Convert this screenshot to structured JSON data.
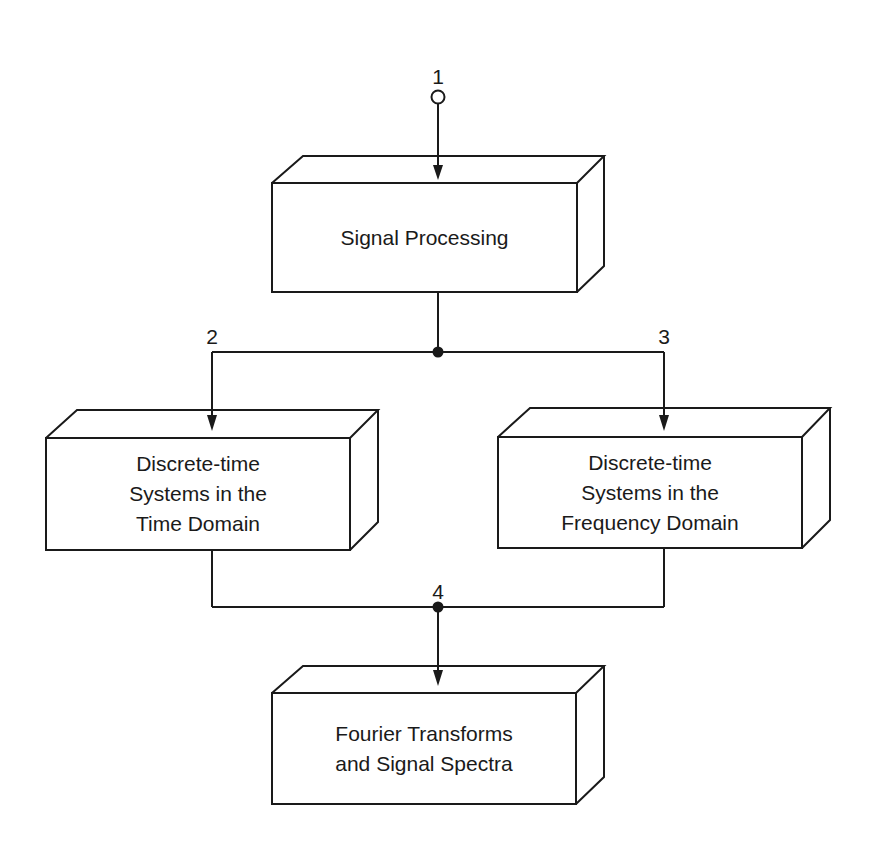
{
  "diagram": {
    "line_color": "#1a1a1a",
    "background": "#ffffff",
    "nodes": {
      "n1": "1",
      "n2": "2",
      "n3": "3",
      "n4": "4"
    },
    "boxes": {
      "signal_processing": {
        "lines": [
          "Signal Processing"
        ]
      },
      "time_domain": {
        "lines": [
          "Discrete-time",
          "Systems in the",
          "Time Domain"
        ]
      },
      "frequency_domain": {
        "lines": [
          "Discrete-time",
          "Systems in the",
          "Frequency Domain"
        ]
      },
      "fourier": {
        "lines": [
          "Fourier Transforms",
          "and Signal Spectra"
        ]
      }
    }
  }
}
